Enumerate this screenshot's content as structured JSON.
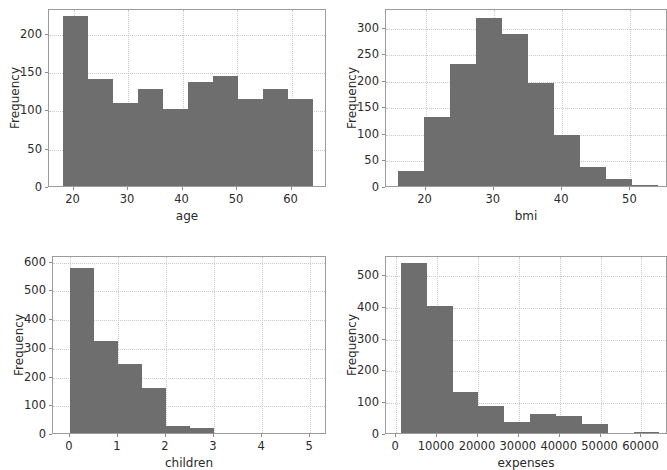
{
  "figure": {
    "background_color": "#ffffff",
    "bar_color": "#6e6e6e",
    "grid_color": "#c9c9c9",
    "axis_color": "#9b9b9b",
    "text_color": "#2b2b2b",
    "layout": "2x2 grid of histograms"
  },
  "chart_data": [
    {
      "type": "bar",
      "id": "age-histogram",
      "title": "",
      "xlabel": "age",
      "ylabel": "Frequency",
      "xlim": [
        15.5,
        66.5
      ],
      "ylim": [
        0,
        232
      ],
      "xticks": [
        20,
        30,
        40,
        50,
        60
      ],
      "xtick_labels": [
        "20",
        "30",
        "40",
        "50",
        "60"
      ],
      "yticks": [
        0,
        50,
        100,
        150,
        200
      ],
      "ytick_labels": [
        "0",
        "50",
        "100",
        "150",
        "200"
      ],
      "grid": true,
      "bin_edges": [
        18,
        22.6,
        27.2,
        31.8,
        36.4,
        41,
        45.6,
        50.2,
        54.8,
        59.4,
        64
      ],
      "values": [
        222,
        139,
        108,
        126,
        101,
        136,
        143,
        113,
        126,
        113
      ]
    },
    {
      "type": "bar",
      "id": "bmi-histogram",
      "title": "",
      "xlabel": "bmi",
      "ylabel": "Frequency",
      "xlim": [
        14.2,
        55.5
      ],
      "ylim": [
        0,
        335
      ],
      "xticks": [
        20,
        30,
        40,
        50
      ],
      "xtick_labels": [
        "20",
        "30",
        "40",
        "50"
      ],
      "yticks": [
        0,
        50,
        100,
        150,
        200,
        250,
        300
      ],
      "ytick_labels": [
        "0",
        "50",
        "100",
        "150",
        "200",
        "250",
        "300"
      ],
      "grid": true,
      "bin_edges": [
        16.0,
        19.8,
        23.6,
        27.4,
        31.2,
        35.0,
        38.8,
        42.6,
        46.4,
        50.2,
        54.0
      ],
      "values": [
        29,
        129,
        230,
        317,
        287,
        194,
        96,
        35,
        14,
        2
      ]
    },
    {
      "type": "bar",
      "id": "children-histogram",
      "title": "",
      "xlabel": "children",
      "ylabel": "Frequency",
      "xlim": [
        -0.35,
        5.35
      ],
      "ylim": [
        0,
        620
      ],
      "xticks": [
        0,
        1,
        2,
        3,
        4,
        5
      ],
      "xtick_labels": [
        "0",
        "1",
        "2",
        "3",
        "4",
        "5"
      ],
      "yticks": [
        0,
        100,
        200,
        300,
        400,
        500,
        600
      ],
      "ytick_labels": [
        "0",
        "100",
        "200",
        "300",
        "400",
        "500",
        "600"
      ],
      "grid": true,
      "bin_edges": [
        0,
        0.5,
        1,
        1.5,
        2,
        2.5,
        3,
        3.5,
        4,
        4.5,
        5
      ],
      "categories": [
        "0",
        "1",
        "2",
        "3",
        "4",
        "5"
      ],
      "values": [
        574,
        322,
        240,
        158,
        25,
        18
      ]
    },
    {
      "type": "bar",
      "id": "expenses-histogram",
      "title": "",
      "xlabel": "expenses",
      "ylabel": "Frequency",
      "xlim": [
        -2500,
        66500
      ],
      "ylim": [
        0,
        560
      ],
      "xticks": [
        0,
        10000,
        20000,
        30000,
        40000,
        50000,
        60000
      ],
      "xtick_labels": [
        "0",
        "10000",
        "20000",
        "30000",
        "40000",
        "50000",
        "60000"
      ],
      "yticks": [
        0,
        100,
        200,
        300,
        400,
        500
      ],
      "ytick_labels": [
        "0",
        "100",
        "200",
        "300",
        "400",
        "500"
      ],
      "grid": true,
      "bin_edges": [
        1122,
        7450,
        13778,
        20106,
        26434,
        32762,
        39090,
        45418,
        51746,
        58074,
        64402
      ],
      "values": [
        535,
        400,
        129,
        84,
        35,
        59,
        55,
        28,
        0,
        2
      ]
    }
  ]
}
